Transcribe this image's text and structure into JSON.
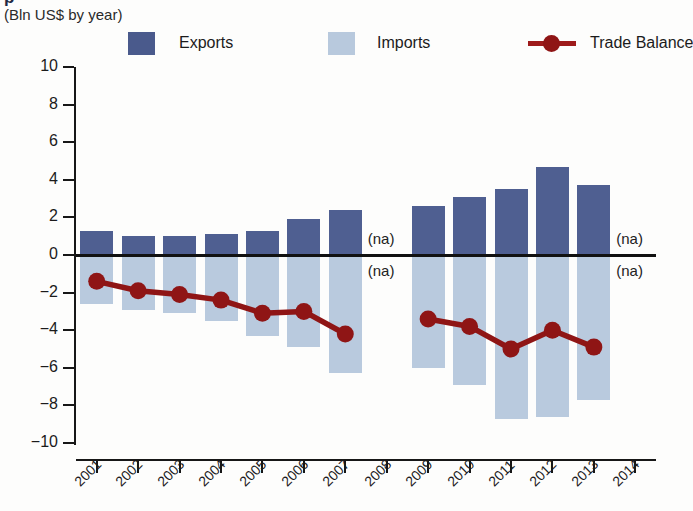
{
  "header": {
    "title_partial": "p",
    "subtitle": "(Bln US$ by year)"
  },
  "legend": {
    "exports": {
      "label": "Exports",
      "color": "#4f5f91",
      "icon": "square-swatch-icon"
    },
    "imports": {
      "label": "Imports",
      "color": "#b9cade",
      "icon": "square-swatch-icon"
    },
    "balance": {
      "label": "Trade Balance",
      "color": "#8f1515",
      "icon": "line-marker-icon"
    }
  },
  "axes": {
    "y_ticks": [
      "10",
      "8",
      "6",
      "4",
      "2",
      "0",
      "−2",
      "−4",
      "−6",
      "−8",
      "−10"
    ],
    "y_values": [
      10,
      8,
      6,
      4,
      2,
      0,
      -2,
      -4,
      -6,
      -8,
      -10
    ],
    "x_ticks": [
      "2001",
      "2002",
      "2003",
      "2004",
      "2005",
      "2006",
      "2007",
      "2008",
      "2009",
      "2010",
      "2011",
      "2012",
      "2013",
      "2014"
    ]
  },
  "na_labels": [
    {
      "year": "2008",
      "position": "above-zero",
      "text": "(na)"
    },
    {
      "year": "2008",
      "position": "below-zero",
      "text": "(na)"
    },
    {
      "year": "2014",
      "position": "above-zero",
      "text": "(na)"
    },
    {
      "year": "2014",
      "position": "below-zero",
      "text": "(na)"
    }
  ],
  "chart_data": {
    "type": "bar",
    "title": "(Bln US$ by year)",
    "xlabel": "",
    "ylabel": "",
    "ylim": [
      -10,
      10
    ],
    "y_tick_step": 2,
    "grid": false,
    "legend_position": "top",
    "categories": [
      "2001",
      "2002",
      "2003",
      "2004",
      "2005",
      "2006",
      "2007",
      "2008",
      "2009",
      "2010",
      "2011",
      "2012",
      "2013",
      "2014"
    ],
    "series": [
      {
        "name": "Exports",
        "type": "bar",
        "color": "#4f5f91",
        "values": [
          1.3,
          1.0,
          1.0,
          1.1,
          1.3,
          1.9,
          2.4,
          null,
          2.6,
          3.1,
          3.5,
          4.7,
          3.7,
          null
        ]
      },
      {
        "name": "Imports",
        "type": "bar",
        "color": "#b9cade",
        "values": [
          -2.6,
          -2.9,
          -3.1,
          -3.5,
          -4.3,
          -4.9,
          -6.3,
          null,
          -6.0,
          -6.9,
          -8.7,
          -8.6,
          -7.7,
          null
        ]
      },
      {
        "name": "Trade Balance",
        "type": "line",
        "color": "#8f1515",
        "values": [
          -1.4,
          -1.9,
          -2.1,
          -2.4,
          -3.1,
          -3.0,
          -4.2,
          null,
          -3.4,
          -3.8,
          -5.0,
          -4.0,
          -4.9,
          null
        ]
      }
    ],
    "missing_data_note": "(na)",
    "missing_years": [
      "2008",
      "2014"
    ]
  }
}
